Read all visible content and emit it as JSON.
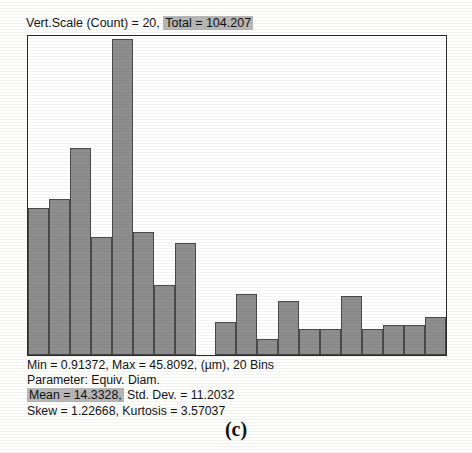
{
  "header": {
    "vert_scale_text": "Vert.Scale (Count) = 20,",
    "total_text": "Total = 104.207"
  },
  "stats": {
    "line1": "Min = 0.91372, Max = 45.8092, (µm), 20 Bins",
    "line2": "Parameter: Equiv. Diam.",
    "line3_highlight": "Mean = 14.3328,",
    "line3_rest": " Std. Dev. = 11.2032",
    "line4": "Skew = 1.22668, Kurtosis = 3.57037"
  },
  "caption": "(c)",
  "colors": {
    "bar_fill": "#8e8e8e",
    "bar_edge": "#4a4a4a",
    "frame": "#2a2a2a",
    "highlight": "#b8b8b8",
    "plot_bg": "#ffffff"
  },
  "chart_data": {
    "type": "bar",
    "xlabel": "Equiv. Diam. (µm)",
    "ylabel": "Count",
    "ylim": [
      0,
      20
    ],
    "grid": false,
    "legend": "none",
    "bins": 20,
    "bin_min": 0.91372,
    "bin_max": 45.8092,
    "units": "µm",
    "parameter": "Equiv. Diam.",
    "total": 104.207,
    "mean": 14.3328,
    "std_dev": 11.2032,
    "skew": 1.22668,
    "kurtosis": 3.57037,
    "categories": [
      "1",
      "2",
      "3",
      "4",
      "5",
      "6",
      "7",
      "8",
      "9",
      "10",
      "11",
      "12",
      "13",
      "14",
      "15",
      "16",
      "17",
      "18",
      "19",
      "20"
    ],
    "values": [
      9.2,
      9.8,
      13.0,
      7.4,
      19.8,
      7.7,
      4.4,
      7.0,
      0.0,
      2.1,
      3.8,
      1.0,
      3.4,
      1.6,
      1.6,
      3.7,
      1.6,
      1.9,
      1.9,
      2.4
    ]
  }
}
